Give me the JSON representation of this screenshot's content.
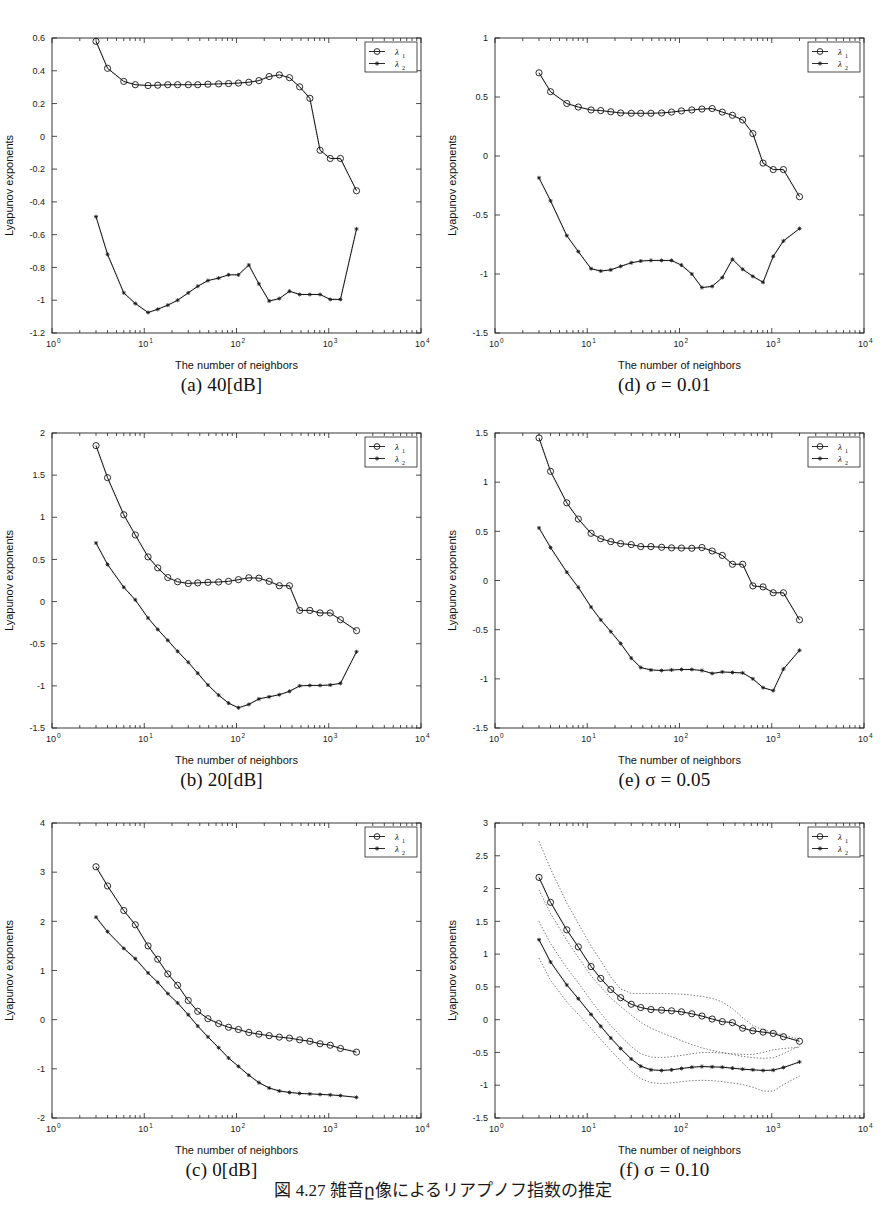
{
  "figure": {
    "bottom_caption": "図 4.27  雑音ը像によるリアプノフ指数の推定",
    "axis": {
      "xlabel": "The number of neighbors",
      "ylabel": "Lyapunov exponents"
    },
    "legend": {
      "series1": "λ",
      "series1_sub": "1",
      "series2": "λ",
      "series2_sub": "2"
    },
    "xticks": [
      "0",
      "1",
      "2",
      "3",
      "4"
    ],
    "xbase": "10"
  },
  "chart_data": [
    {
      "id": "a",
      "type": "line",
      "caption": "(a) 40[dB]",
      "title": "40[dB]",
      "xlabel": "The number of neighbors",
      "ylabel": "Lyapunov exponents",
      "xscale": "log",
      "xlim": [
        1,
        10000
      ],
      "ylim": [
        -1.2,
        0.6
      ],
      "yticks": [
        -1.2,
        -1,
        -0.8,
        -0.6,
        -0.4,
        -0.2,
        0,
        0.2,
        0.4,
        0.6
      ],
      "xticks_log": [
        0,
        1,
        2,
        3,
        4
      ],
      "grid": false,
      "legend_position": "upper-right",
      "x": [
        3,
        4,
        6,
        8,
        11,
        14,
        18,
        23,
        30,
        38,
        49,
        64,
        82,
        105,
        136,
        175,
        226,
        291,
        375,
        484,
        624,
        805,
        1038,
        1339,
        2000
      ],
      "series": [
        {
          "name": "λ1",
          "marker": "circle",
          "values": [
            0.58,
            0.415,
            0.335,
            0.315,
            0.31,
            0.312,
            0.315,
            0.315,
            0.315,
            0.315,
            0.318,
            0.32,
            0.322,
            0.325,
            0.33,
            0.34,
            0.365,
            0.375,
            0.358,
            0.302,
            0.232,
            -0.085,
            -0.135,
            -0.135,
            -0.332
          ]
        },
        {
          "name": "λ2",
          "marker": "star",
          "values": [
            -0.49,
            -0.72,
            -0.955,
            -1.02,
            -1.075,
            -1.055,
            -1.03,
            -1.0,
            -0.955,
            -0.915,
            -0.88,
            -0.865,
            -0.845,
            -0.845,
            -0.785,
            -0.9,
            -1.005,
            -0.99,
            -0.945,
            -0.965,
            -0.965,
            -0.965,
            -0.995,
            -0.995,
            -0.565
          ]
        }
      ]
    },
    {
      "id": "d",
      "type": "line",
      "caption": "(d) σ = 0.01",
      "title": "σ = 0.01",
      "xlabel": "The number of neighbors",
      "ylabel": "Lyapunov exponents",
      "xscale": "log",
      "xlim": [
        1,
        10000
      ],
      "ylim": [
        -1.5,
        1
      ],
      "yticks": [
        -1.5,
        -1,
        -0.5,
        0,
        0.5,
        1
      ],
      "xticks_log": [
        0,
        1,
        2,
        3,
        4
      ],
      "grid": false,
      "legend_position": "upper-right",
      "x": [
        3,
        4,
        6,
        8,
        11,
        14,
        18,
        23,
        30,
        38,
        49,
        64,
        82,
        105,
        136,
        175,
        226,
        291,
        375,
        484,
        624,
        805,
        1038,
        1339,
        2000
      ],
      "series": [
        {
          "name": "λ1",
          "marker": "circle",
          "values": [
            0.705,
            0.545,
            0.445,
            0.415,
            0.39,
            0.385,
            0.375,
            0.365,
            0.362,
            0.362,
            0.362,
            0.365,
            0.372,
            0.382,
            0.39,
            0.398,
            0.402,
            0.372,
            0.345,
            0.305,
            0.19,
            -0.06,
            -0.115,
            -0.115,
            -0.345
          ]
        },
        {
          "name": "λ2",
          "marker": "star",
          "values": [
            -0.185,
            -0.38,
            -0.675,
            -0.81,
            -0.955,
            -0.975,
            -0.965,
            -0.935,
            -0.905,
            -0.89,
            -0.885,
            -0.885,
            -0.885,
            -0.925,
            -1.0,
            -1.115,
            -1.105,
            -1.03,
            -0.875,
            -0.96,
            -1.02,
            -1.07,
            -0.85,
            -0.72,
            -0.615
          ]
        }
      ]
    },
    {
      "id": "b",
      "type": "line",
      "caption": "(b) 20[dB]",
      "title": "20[dB]",
      "xlabel": "The number of neighbors",
      "ylabel": "Lyapunov exponents",
      "xscale": "log",
      "xlim": [
        1,
        10000
      ],
      "ylim": [
        -1.5,
        2
      ],
      "yticks": [
        -1.5,
        -1,
        -0.5,
        0,
        0.5,
        1,
        1.5,
        2
      ],
      "xticks_log": [
        0,
        1,
        2,
        3,
        4
      ],
      "grid": false,
      "legend_position": "upper-right",
      "x": [
        3,
        4,
        6,
        8,
        11,
        14,
        18,
        23,
        30,
        38,
        49,
        64,
        82,
        105,
        136,
        175,
        226,
        291,
        375,
        484,
        624,
        805,
        1038,
        1339,
        2000
      ],
      "series": [
        {
          "name": "λ1",
          "marker": "circle",
          "values": [
            1.85,
            1.47,
            1.03,
            0.79,
            0.53,
            0.4,
            0.285,
            0.235,
            0.215,
            0.222,
            0.228,
            0.232,
            0.24,
            0.26,
            0.282,
            0.278,
            0.24,
            0.188,
            0.188,
            -0.105,
            -0.105,
            -0.135,
            -0.135,
            -0.215,
            -0.345
          ]
        },
        {
          "name": "λ2",
          "marker": "star",
          "values": [
            0.695,
            0.44,
            0.17,
            0.02,
            -0.195,
            -0.33,
            -0.46,
            -0.59,
            -0.72,
            -0.85,
            -0.99,
            -1.11,
            -1.205,
            -1.26,
            -1.22,
            -1.155,
            -1.13,
            -1.105,
            -1.065,
            -1.0,
            -0.995,
            -0.995,
            -0.99,
            -0.97,
            -0.595
          ]
        }
      ]
    },
    {
      "id": "e",
      "type": "line",
      "caption": "(e) σ = 0.05",
      "title": "σ = 0.05",
      "xlabel": "The number of neighbors",
      "ylabel": "Lyapunov exponents",
      "xscale": "log",
      "xlim": [
        1,
        10000
      ],
      "ylim": [
        -1.5,
        1.5
      ],
      "yticks": [
        -1.5,
        -1,
        -0.5,
        0,
        0.5,
        1,
        1.5
      ],
      "xticks_log": [
        0,
        1,
        2,
        3,
        4
      ],
      "grid": false,
      "legend_position": "upper-right",
      "x": [
        3,
        4,
        6,
        8,
        11,
        14,
        18,
        23,
        30,
        38,
        49,
        64,
        82,
        105,
        136,
        175,
        226,
        291,
        375,
        484,
        624,
        805,
        1038,
        1339,
        2000
      ],
      "series": [
        {
          "name": "λ1",
          "marker": "circle",
          "values": [
            1.45,
            1.11,
            0.79,
            0.625,
            0.48,
            0.425,
            0.395,
            0.375,
            0.365,
            0.345,
            0.345,
            0.338,
            0.332,
            0.33,
            0.328,
            0.335,
            0.3,
            0.255,
            0.165,
            0.165,
            -0.055,
            -0.065,
            -0.125,
            -0.125,
            -0.4
          ]
        },
        {
          "name": "λ2",
          "marker": "star",
          "values": [
            0.535,
            0.335,
            0.085,
            -0.07,
            -0.27,
            -0.4,
            -0.52,
            -0.64,
            -0.79,
            -0.885,
            -0.91,
            -0.915,
            -0.91,
            -0.905,
            -0.905,
            -0.915,
            -0.945,
            -0.93,
            -0.935,
            -0.94,
            -1.0,
            -1.09,
            -1.12,
            -0.9,
            -0.71
          ]
        }
      ]
    },
    {
      "id": "c",
      "type": "line",
      "caption": "(c) 0[dB]",
      "title": "0[dB]",
      "xlabel": "The number of neighbors",
      "ylabel": "Lyapunov exponents",
      "xscale": "log",
      "xlim": [
        1,
        10000
      ],
      "ylim": [
        -2,
        4
      ],
      "yticks": [
        -2,
        -1,
        0,
        1,
        2,
        3,
        4
      ],
      "xticks_log": [
        0,
        1,
        2,
        3,
        4
      ],
      "grid": false,
      "legend_position": "upper-right",
      "x": [
        3,
        4,
        6,
        8,
        11,
        14,
        18,
        23,
        30,
        38,
        49,
        64,
        82,
        105,
        136,
        175,
        226,
        291,
        375,
        484,
        624,
        805,
        1038,
        1339,
        2000
      ],
      "series": [
        {
          "name": "λ1",
          "marker": "circle",
          "values": [
            3.11,
            2.72,
            2.22,
            1.93,
            1.5,
            1.23,
            0.93,
            0.7,
            0.39,
            0.17,
            0.02,
            -0.08,
            -0.155,
            -0.2,
            -0.26,
            -0.295,
            -0.325,
            -0.355,
            -0.375,
            -0.41,
            -0.44,
            -0.49,
            -0.52,
            -0.585,
            -0.66
          ]
        },
        {
          "name": "λ2",
          "marker": "star",
          "values": [
            2.085,
            1.79,
            1.45,
            1.24,
            0.95,
            0.76,
            0.53,
            0.34,
            0.1,
            -0.13,
            -0.35,
            -0.57,
            -0.78,
            -0.95,
            -1.13,
            -1.28,
            -1.39,
            -1.45,
            -1.48,
            -1.5,
            -1.51,
            -1.52,
            -1.53,
            -1.545,
            -1.58
          ]
        }
      ]
    },
    {
      "id": "f",
      "type": "line",
      "caption": "(f) σ = 0.10",
      "title": "σ = 0.10",
      "xlabel": "The number of neighbors",
      "ylabel": "Lyapunov exponents",
      "xscale": "log",
      "xlim": [
        1,
        10000
      ],
      "ylim": [
        -1.5,
        3
      ],
      "yticks": [
        -1.5,
        -1,
        -0.5,
        0,
        0.5,
        1,
        1.5,
        2,
        2.5,
        3
      ],
      "xticks_log": [
        0,
        1,
        2,
        3,
        4
      ],
      "grid": false,
      "legend_position": "upper-right",
      "has_error_bands": true,
      "x": [
        3,
        4,
        6,
        8,
        11,
        14,
        18,
        23,
        30,
        38,
        49,
        64,
        82,
        105,
        136,
        175,
        226,
        291,
        375,
        484,
        624,
        805,
        1038,
        1339,
        2000
      ],
      "series": [
        {
          "name": "λ1",
          "marker": "circle",
          "values": [
            2.17,
            1.79,
            1.37,
            1.11,
            0.81,
            0.63,
            0.46,
            0.335,
            0.235,
            0.185,
            0.155,
            0.145,
            0.135,
            0.12,
            0.09,
            0.055,
            0.01,
            -0.03,
            -0.045,
            -0.13,
            -0.17,
            -0.19,
            -0.21,
            -0.26,
            -0.33
          ],
          "upper": [
            2.72,
            2.3,
            1.78,
            1.47,
            1.12,
            0.9,
            0.65,
            0.47,
            0.4,
            0.4,
            0.4,
            0.4,
            0.395,
            0.39,
            0.375,
            0.355,
            0.325,
            0.27,
            0.17,
            0.03,
            -0.09,
            -0.155,
            -0.19,
            -0.235,
            -0.3
          ],
          "lower": [
            1.98,
            1.62,
            1.21,
            0.95,
            0.67,
            0.5,
            0.33,
            0.2,
            0.07,
            -0.04,
            -0.13,
            -0.2,
            -0.26,
            -0.32,
            -0.38,
            -0.43,
            -0.47,
            -0.5,
            -0.53,
            -0.56,
            -0.58,
            -0.59,
            -0.58,
            -0.52,
            -0.4
          ]
        },
        {
          "name": "λ2",
          "marker": "star",
          "values": [
            1.22,
            0.88,
            0.53,
            0.32,
            0.08,
            -0.1,
            -0.28,
            -0.44,
            -0.6,
            -0.71,
            -0.765,
            -0.775,
            -0.765,
            -0.745,
            -0.725,
            -0.715,
            -0.72,
            -0.725,
            -0.74,
            -0.755,
            -0.765,
            -0.775,
            -0.77,
            -0.73,
            -0.645
          ],
          "upper": [
            1.5,
            1.16,
            0.79,
            0.56,
            0.29,
            0.1,
            -0.09,
            -0.25,
            -0.41,
            -0.52,
            -0.57,
            -0.58,
            -0.565,
            -0.545,
            -0.52,
            -0.5,
            -0.5,
            -0.51,
            -0.52,
            -0.53,
            -0.53,
            -0.5,
            -0.46,
            -0.44,
            -0.42
          ],
          "lower": [
            0.94,
            0.6,
            0.27,
            0.08,
            -0.13,
            -0.3,
            -0.47,
            -0.63,
            -0.79,
            -0.9,
            -0.96,
            -0.975,
            -0.965,
            -0.945,
            -0.93,
            -0.925,
            -0.93,
            -0.945,
            -0.965,
            -0.99,
            -1.03,
            -1.09,
            -1.09,
            -0.99,
            -0.86
          ]
        }
      ]
    }
  ]
}
